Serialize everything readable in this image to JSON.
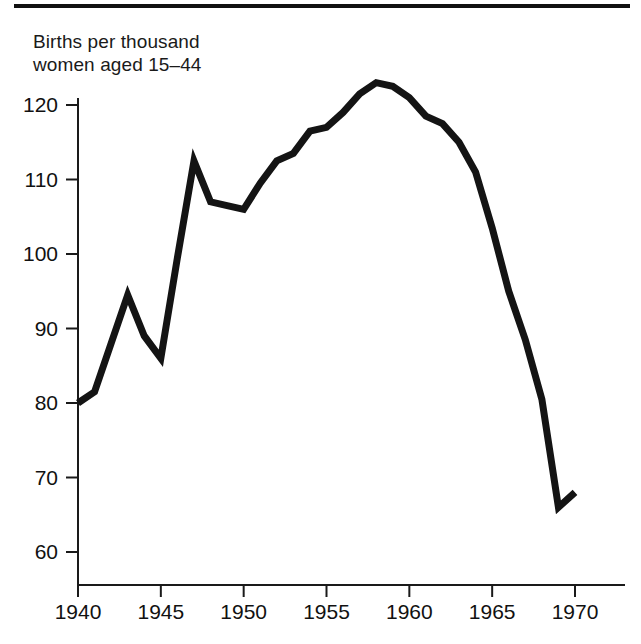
{
  "figure": {
    "title_line1": "Births per thousand",
    "title_line2": "women aged 15–44",
    "line_color": "#141414",
    "axis_color": "#1a1a1a",
    "background": "#ffffff"
  },
  "chart_data": {
    "type": "line",
    "xlabel": "",
    "ylabel": "Births per thousand women aged 15–44",
    "xlim": [
      1940,
      1970
    ],
    "ylim": [
      57,
      125
    ],
    "grid": false,
    "legend": null,
    "xticks": [
      1940,
      1945,
      1950,
      1955,
      1960,
      1965,
      1970
    ],
    "xtick_labels": [
      "1940",
      "1945",
      "1950",
      "1955",
      "1960",
      "1965",
      "1970"
    ],
    "yticks": [
      60,
      70,
      80,
      90,
      100,
      110,
      120
    ],
    "ytick_labels": [
      "60",
      "70",
      "80",
      "90",
      "100",
      "110",
      "120"
    ],
    "x": [
      1940,
      1941,
      1942,
      1943,
      1944,
      1945,
      1946,
      1947,
      1948,
      1949,
      1950,
      1951,
      1952,
      1953,
      1954,
      1955,
      1956,
      1957,
      1958,
      1959,
      1960,
      1961,
      1962,
      1963,
      1964,
      1965,
      1966,
      1967,
      1968,
      1969,
      1970
    ],
    "values": [
      80.0,
      81.5,
      88.0,
      94.5,
      89.0,
      86.0,
      99.5,
      112.5,
      107.0,
      106.5,
      106.0,
      109.5,
      112.5,
      113.5,
      116.5,
      117.0,
      119.0,
      121.5,
      123.0,
      122.5,
      121.0,
      118.5,
      117.5,
      115.0,
      111.0,
      103.5,
      95.0,
      88.5,
      80.5,
      66.0,
      68.0
    ]
  }
}
